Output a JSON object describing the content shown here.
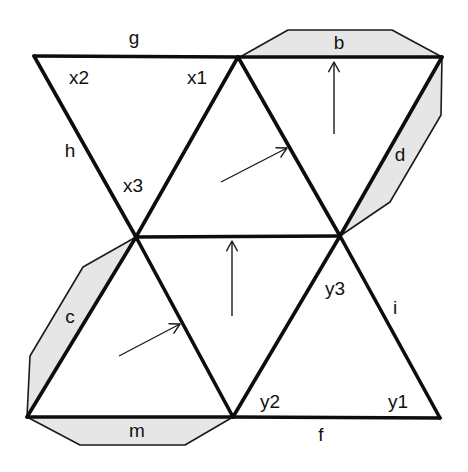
{
  "diagram": {
    "colors": {
      "edge": "#0d0d0d",
      "flap_fill": "#e6e6e6",
      "background": "#ffffff",
      "text": "#111111"
    },
    "vertices": {
      "TL": [
        34,
        56
      ],
      "TM": [
        238,
        57
      ],
      "TR": [
        442,
        57
      ],
      "ML": [
        136,
        237
      ],
      "MR": [
        340,
        236
      ],
      "BL": [
        27,
        417
      ],
      "BM": [
        233,
        417
      ],
      "BR": [
        440,
        418
      ]
    },
    "faces": [
      {
        "id": "face-x",
        "points": "34,56 238,57 136,237"
      },
      {
        "id": "face-upper-1",
        "points": "238,57 136,237 340,236"
      },
      {
        "id": "face-upper-2",
        "points": "238,57 442,57 340,236"
      },
      {
        "id": "face-lower-1",
        "points": "136,237 27,417 233,417"
      },
      {
        "id": "face-lower-2",
        "points": "136,237 340,236 233,417"
      },
      {
        "id": "face-y",
        "points": "340,236 233,417 440,418"
      }
    ],
    "flaps": [
      {
        "id": "flap-b",
        "label": "b",
        "points": "240,57 288,30 392,30 442,57",
        "label_pos": [
          339,
          44
        ]
      },
      {
        "id": "flap-d",
        "label": "d",
        "points": "442,57 441,115 390,202 340,236",
        "label_pos": [
          400,
          156
        ]
      },
      {
        "id": "flap-c",
        "label": "c",
        "points": "136,237 83,267 30,356 27,417",
        "label_pos": [
          70,
          318
        ]
      },
      {
        "id": "flap-m",
        "label": "m",
        "points": "27,417 80,445 185,445 233,417",
        "label_pos": [
          137,
          432
        ]
      }
    ],
    "edge_labels": [
      {
        "id": "g",
        "text": "g",
        "pos": [
          134,
          39
        ]
      },
      {
        "id": "h",
        "text": "h",
        "pos": [
          70,
          152
        ]
      },
      {
        "id": "i",
        "text": "i",
        "pos": [
          395,
          309
        ]
      },
      {
        "id": "f",
        "text": "f",
        "pos": [
          321,
          436
        ]
      }
    ],
    "vertex_labels": [
      {
        "id": "x1",
        "text": "x1",
        "pos": [
          197,
          79
        ]
      },
      {
        "id": "x2",
        "text": "x2",
        "pos": [
          79,
          79
        ]
      },
      {
        "id": "x3",
        "text": "x3",
        "pos": [
          133,
          187
        ]
      },
      {
        "id": "y1",
        "text": "y1",
        "pos": [
          398,
          403
        ]
      },
      {
        "id": "y2",
        "text": "y2",
        "pos": [
          270,
          403
        ]
      },
      {
        "id": "y3",
        "text": "y3",
        "pos": [
          335,
          290
        ]
      }
    ],
    "arrows": [
      {
        "id": "arrow-upper-diagonal",
        "from": [
          221,
          182
        ],
        "to": [
          287,
          148
        ]
      },
      {
        "id": "arrow-upper-vertical",
        "from": [
          334,
          134
        ],
        "to": [
          334,
          62
        ]
      },
      {
        "id": "arrow-lower-diagonal",
        "from": [
          119,
          356
        ],
        "to": [
          180,
          324
        ]
      },
      {
        "id": "arrow-lower-vertical",
        "from": [
          232,
          316
        ],
        "to": [
          232,
          241
        ]
      }
    ]
  }
}
